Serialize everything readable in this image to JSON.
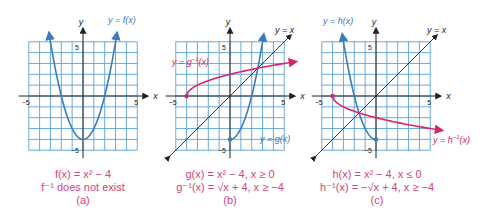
{
  "chart_data": [
    {
      "type": "line",
      "panel": "(a)",
      "xlim": [
        -5,
        5
      ],
      "ylim": [
        -5,
        5
      ],
      "xlabel": "x",
      "ylabel": "y",
      "ticks": {
        "x": [
          -5,
          5
        ],
        "y": [
          5,
          -5
        ]
      },
      "grid": true,
      "series": [
        {
          "name": "y = f(x)",
          "function": "x^2 - 4",
          "domain": [
            -3.2,
            3.2
          ],
          "color": "#3a7bbf",
          "points": [
            [
              -3,
              5
            ],
            [
              -2,
              0
            ],
            [
              -1,
              -3
            ],
            [
              0,
              -4
            ],
            [
              1,
              -3
            ],
            [
              2,
              0
            ],
            [
              3,
              5
            ]
          ]
        }
      ],
      "caption": [
        "f(x) = x² − 4",
        "f⁻¹ does not exist",
        "(a)"
      ]
    },
    {
      "type": "line",
      "panel": "(b)",
      "xlim": [
        -5,
        5
      ],
      "ylim": [
        -5,
        5
      ],
      "xlabel": "x",
      "ylabel": "y",
      "ticks": {
        "x": [
          -5,
          5
        ],
        "y": [
          5,
          -5
        ]
      },
      "grid": true,
      "series": [
        {
          "name": "y = g(x)",
          "function": "x^2 - 4, x ≥ 0",
          "domain": [
            0,
            3.2
          ],
          "color": "#3a7bbf",
          "points": [
            [
              0,
              -4
            ],
            [
              1,
              -3
            ],
            [
              2,
              0
            ],
            [
              3,
              5
            ]
          ]
        },
        {
          "name": "y = g⁻¹(x)",
          "function": "sqrt(x + 4), x ≥ -4",
          "domain": [
            -4,
            6
          ],
          "color": "#d6256a",
          "points": [
            [
              -4,
              0
            ],
            [
              -3,
              1
            ],
            [
              0,
              2
            ],
            [
              5,
              3
            ]
          ]
        },
        {
          "name": "y = x",
          "function": "x",
          "domain": [
            -6,
            6
          ],
          "color": "#333333"
        }
      ],
      "caption": [
        "g(x) = x² − 4, x ≥ 0",
        "g⁻¹(x) = √(x + 4), x ≥ −4",
        "(b)"
      ]
    },
    {
      "type": "line",
      "panel": "(c)",
      "xlim": [
        -5,
        5
      ],
      "ylim": [
        -5,
        5
      ],
      "xlabel": "x",
      "ylabel": "y",
      "ticks": {
        "x": [
          -5,
          5
        ],
        "y": [
          5,
          -5
        ]
      },
      "grid": true,
      "series": [
        {
          "name": "y = h(x)",
          "function": "x^2 - 4, x ≤ 0",
          "domain": [
            -3.2,
            0
          ],
          "color": "#3a7bbf",
          "points": [
            [
              -3,
              5
            ],
            [
              -2,
              0
            ],
            [
              -1,
              -3
            ],
            [
              0,
              -4
            ]
          ]
        },
        {
          "name": "y = h⁻¹(x)",
          "function": "-sqrt(x + 4), x ≥ -4",
          "domain": [
            -4,
            6
          ],
          "color": "#d6256a",
          "points": [
            [
              -4,
              0
            ],
            [
              -3,
              -1
            ],
            [
              0,
              -2
            ],
            [
              5,
              -3
            ]
          ]
        },
        {
          "name": "y = x",
          "function": "x",
          "domain": [
            -6,
            6
          ],
          "color": "#333333"
        }
      ],
      "caption": [
        "h(x) = x² − 4, x ≤ 0",
        "h⁻¹(x) = −√(x + 4), x ≥ −4",
        "(c)"
      ]
    }
  ],
  "labels": {
    "y_axis": "y",
    "x_axis": "x",
    "tick_pos": "5",
    "tick_neg": "−5",
    "a_curve": "y = f(x)",
    "b_curve_g": "y = g(x)",
    "b_curve_ginv": "y = g",
    "b_curve_ginv_sup": "−1",
    "b_curve_ginv_tail": "(x)",
    "b_identity": "y = x",
    "c_curve_h": "y = h(x)",
    "c_curve_hinv": "y = h",
    "c_curve_hinv_sup": "−1",
    "c_curve_hinv_tail": "(x)",
    "c_identity": "y = x"
  },
  "captions": {
    "a": {
      "line1": "f(x) = x² − 4",
      "line2": "f⁻¹ does not exist",
      "label": "(a)"
    },
    "b": {
      "line1": "g(x) = x² − 4, x ≥ 0",
      "line2": "g⁻¹(x) = √x + 4, x ≥ −4",
      "label": "(b)"
    },
    "c": {
      "line1": "h(x) = x² − 4, x ≤ 0",
      "line2": "h⁻¹(x) = −√x + 4, x ≥ −4",
      "label": "(c)"
    }
  },
  "colors": {
    "grid": "#5aa0d8",
    "curve_blue": "#3a7bbf",
    "curve_pink": "#d6256a",
    "caption": "#d0457a",
    "axis": "#222222"
  }
}
